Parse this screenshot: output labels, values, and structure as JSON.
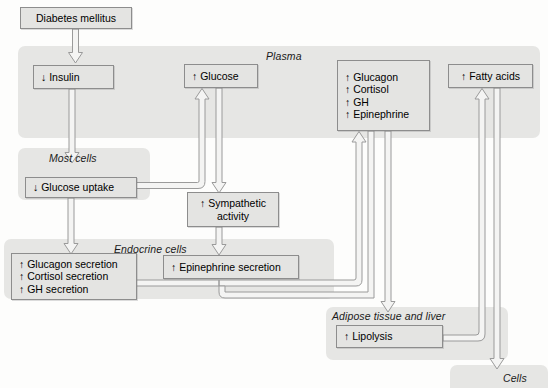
{
  "diagram": {
    "colors": {
      "band": "#e6e6e4",
      "box_fill": "#e4e4e2",
      "box_border": "#8d8d8d",
      "arrow_fill": "#f4f4f3",
      "arrow_stroke": "#9a9a9a",
      "text": "#000000"
    },
    "compartments": [
      {
        "id": "plasma",
        "label": "Plasma"
      },
      {
        "id": "most_cells",
        "label": "Most cells"
      },
      {
        "id": "endocrine",
        "label": "Endocrine cells"
      },
      {
        "id": "adipose",
        "label": "Adipose tissue and liver"
      },
      {
        "id": "cells",
        "label": "Cells"
      }
    ],
    "nodes": {
      "diabetes": {
        "lines": [
          "Diabetes mellitus"
        ]
      },
      "insulin": {
        "lines": [
          "↓ Insulin"
        ]
      },
      "glucose": {
        "lines": [
          "↑ Glucose"
        ]
      },
      "hormones": {
        "lines": [
          "↑ Glucagon",
          "↑ Cortisol",
          "↑ GH",
          "↑ Epinephrine"
        ]
      },
      "fatty_acids": {
        "lines": [
          "↑ Fatty acids"
        ]
      },
      "glucose_uptake": {
        "lines": [
          "↓ Glucose uptake"
        ]
      },
      "sympathetic": {
        "lines": [
          "↑ Sympathetic",
          "activity"
        ]
      },
      "endocrine_secretion": {
        "lines": [
          "↑ Glucagon secretion",
          "↑ Cortisol secretion",
          "↑ GH secretion"
        ]
      },
      "epinephrine_secretion": {
        "lines": [
          "↑ Epinephrine secretion"
        ]
      },
      "lipolysis": {
        "lines": [
          "↑ Lipolysis"
        ]
      }
    }
  }
}
